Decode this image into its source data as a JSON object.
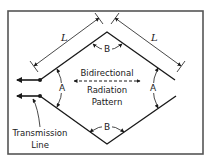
{
  "diagram": {
    "labels": {
      "length_left": "L",
      "length_right": "L",
      "angle_top": "B",
      "angle_bottom": "B",
      "angle_left": "A",
      "angle_right": "A",
      "pattern_line1": "Bidirectional",
      "pattern_line2": "Radiation",
      "pattern_line3": "Pattern",
      "feed_line1": "Transmission",
      "feed_line2": "Line"
    },
    "colors": {
      "line": "#1a1a1a",
      "frame": "#555555",
      "background": "#ffffff"
    }
  }
}
